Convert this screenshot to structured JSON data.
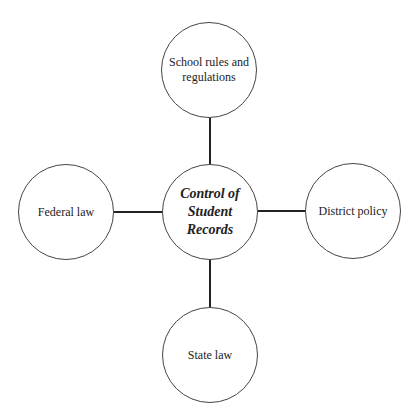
{
  "diagram": {
    "center": {
      "label": "Control of Student Records"
    },
    "nodes": {
      "top": {
        "label": "School rules and regulations"
      },
      "left": {
        "label": "Federal law"
      },
      "right": {
        "label": "District policy"
      },
      "bottom": {
        "label": "State law"
      }
    },
    "colors": {
      "stroke": "#222222",
      "circle_border": "#444444",
      "text": "#222222",
      "background": "#ffffff"
    }
  }
}
